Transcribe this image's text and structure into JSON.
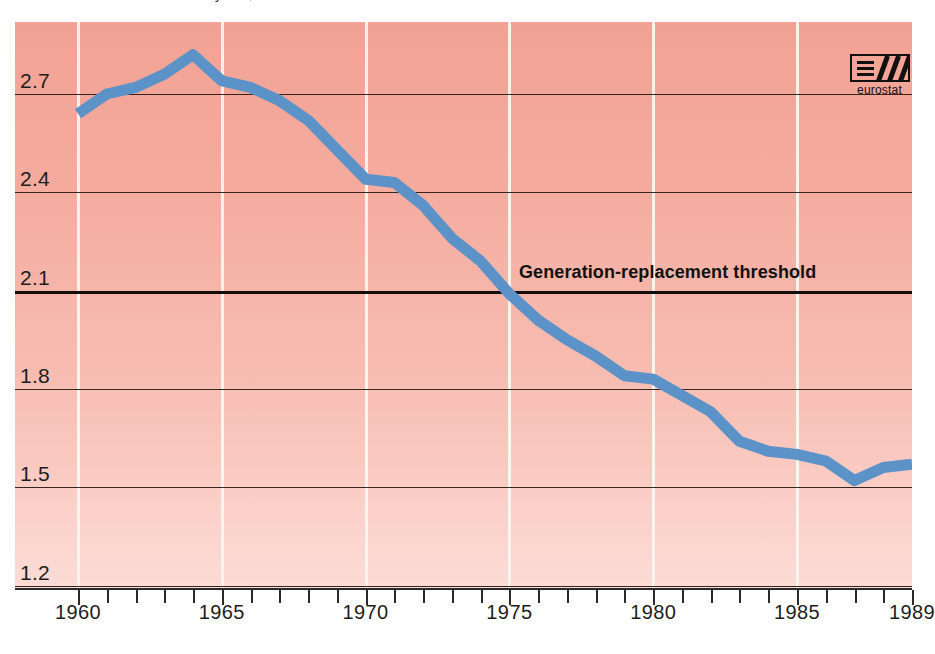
{
  "page": {
    "background": "#ffffff",
    "cropped_heading_remnant": "Total fertility rate, EUR 12"
  },
  "logo": {
    "name": "eurostat",
    "icon": "eurostat-logo"
  },
  "annotation": {
    "threshold_label": "Generation-replacement threshold",
    "threshold_value": 2.1
  },
  "colors": {
    "line": "#5b92c8",
    "plot_top": "#f2a294",
    "plot_bottom": "#fcdcd6",
    "gridline": "#3a2420",
    "vertical_gridline": "#fdf6f3",
    "axis": "#2a2a2a",
    "text": "#1d1d1d"
  },
  "chart_data": {
    "type": "line",
    "title": "",
    "subtitle": "",
    "xlabel": "",
    "ylabel": "",
    "xlim": [
      1960,
      1989
    ],
    "ylim": [
      1.2,
      2.9
    ],
    "ytick_labels": [
      "2.7",
      "2.4",
      "2.1",
      "1.8",
      "1.5",
      "1.2"
    ],
    "yticks": [
      2.7,
      2.4,
      2.1,
      1.8,
      1.5,
      1.2
    ],
    "xtick_labels": [
      "1960",
      "1965",
      "1970",
      "1975",
      "1980",
      "1985",
      "1989"
    ],
    "xticks": [
      1960,
      1965,
      1970,
      1975,
      1980,
      1985,
      1989
    ],
    "minor_xticks_every": 1,
    "grid": "horizontal-solid-and-vertical-at-5yr",
    "legend": "none",
    "annotations": [
      {
        "text": "Generation-replacement threshold",
        "y": 2.1,
        "style": "bold",
        "placement": "above-line-right-of-center"
      }
    ],
    "x": [
      1960,
      1961,
      1962,
      1963,
      1964,
      1965,
      1966,
      1967,
      1968,
      1969,
      1970,
      1971,
      1972,
      1973,
      1974,
      1975,
      1976,
      1977,
      1978,
      1979,
      1980,
      1981,
      1982,
      1983,
      1984,
      1985,
      1986,
      1987,
      1988,
      1989
    ],
    "values": [
      2.64,
      2.7,
      2.72,
      2.76,
      2.82,
      2.74,
      2.72,
      2.68,
      2.62,
      2.53,
      2.44,
      2.43,
      2.36,
      2.26,
      2.19,
      2.09,
      2.01,
      1.95,
      1.9,
      1.84,
      1.83,
      1.78,
      1.73,
      1.64,
      1.61,
      1.6,
      1.58,
      1.52,
      1.56,
      1.57
    ],
    "series": [
      {
        "name": "Total fertility rate",
        "color": "#5b92c8",
        "values": [
          2.64,
          2.7,
          2.72,
          2.76,
          2.82,
          2.74,
          2.72,
          2.68,
          2.62,
          2.53,
          2.44,
          2.43,
          2.36,
          2.26,
          2.19,
          2.09,
          2.01,
          1.95,
          1.9,
          1.84,
          1.83,
          1.78,
          1.73,
          1.64,
          1.61,
          1.6,
          1.58,
          1.52,
          1.56,
          1.57
        ]
      }
    ]
  }
}
